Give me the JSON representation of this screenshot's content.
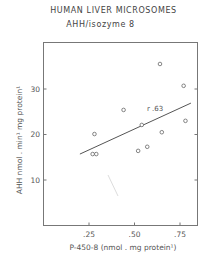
{
  "chart_data": {
    "type": "scatter",
    "title": "HUMAN LIVER MICROSOMES",
    "subtitle": "AHH/isozyme 8",
    "xlabel": "P-450-8 (nmol . mg protein¹)",
    "ylabel": "AHH nmol . min¹ mg protein¹",
    "xlim": [
      0,
      0.85
    ],
    "ylim": [
      0,
      40
    ],
    "x_ticks": [
      0.25,
      0.5,
      0.75
    ],
    "x_tick_labels": [
      ".25",
      ".50",
      ".75"
    ],
    "y_ticks": [
      10,
      20,
      30
    ],
    "y_tick_labels": [
      "10",
      "20",
      "30"
    ],
    "grid": false,
    "points": [
      {
        "x": 0.27,
        "y": 15.7
      },
      {
        "x": 0.29,
        "y": 15.7
      },
      {
        "x": 0.28,
        "y": 20.1
      },
      {
        "x": 0.44,
        "y": 25.4
      },
      {
        "x": 0.52,
        "y": 16.4
      },
      {
        "x": 0.54,
        "y": 22.1
      },
      {
        "x": 0.57,
        "y": 17.3
      },
      {
        "x": 0.64,
        "y": 35.5
      },
      {
        "x": 0.65,
        "y": 20.5
      },
      {
        "x": 0.77,
        "y": 30.7
      },
      {
        "x": 0.78,
        "y": 23.0
      }
    ],
    "regression_line": {
      "x": [
        0.2,
        0.81
      ],
      "y": [
        15.7,
        26.9
      ]
    },
    "annotation": "r .63"
  }
}
